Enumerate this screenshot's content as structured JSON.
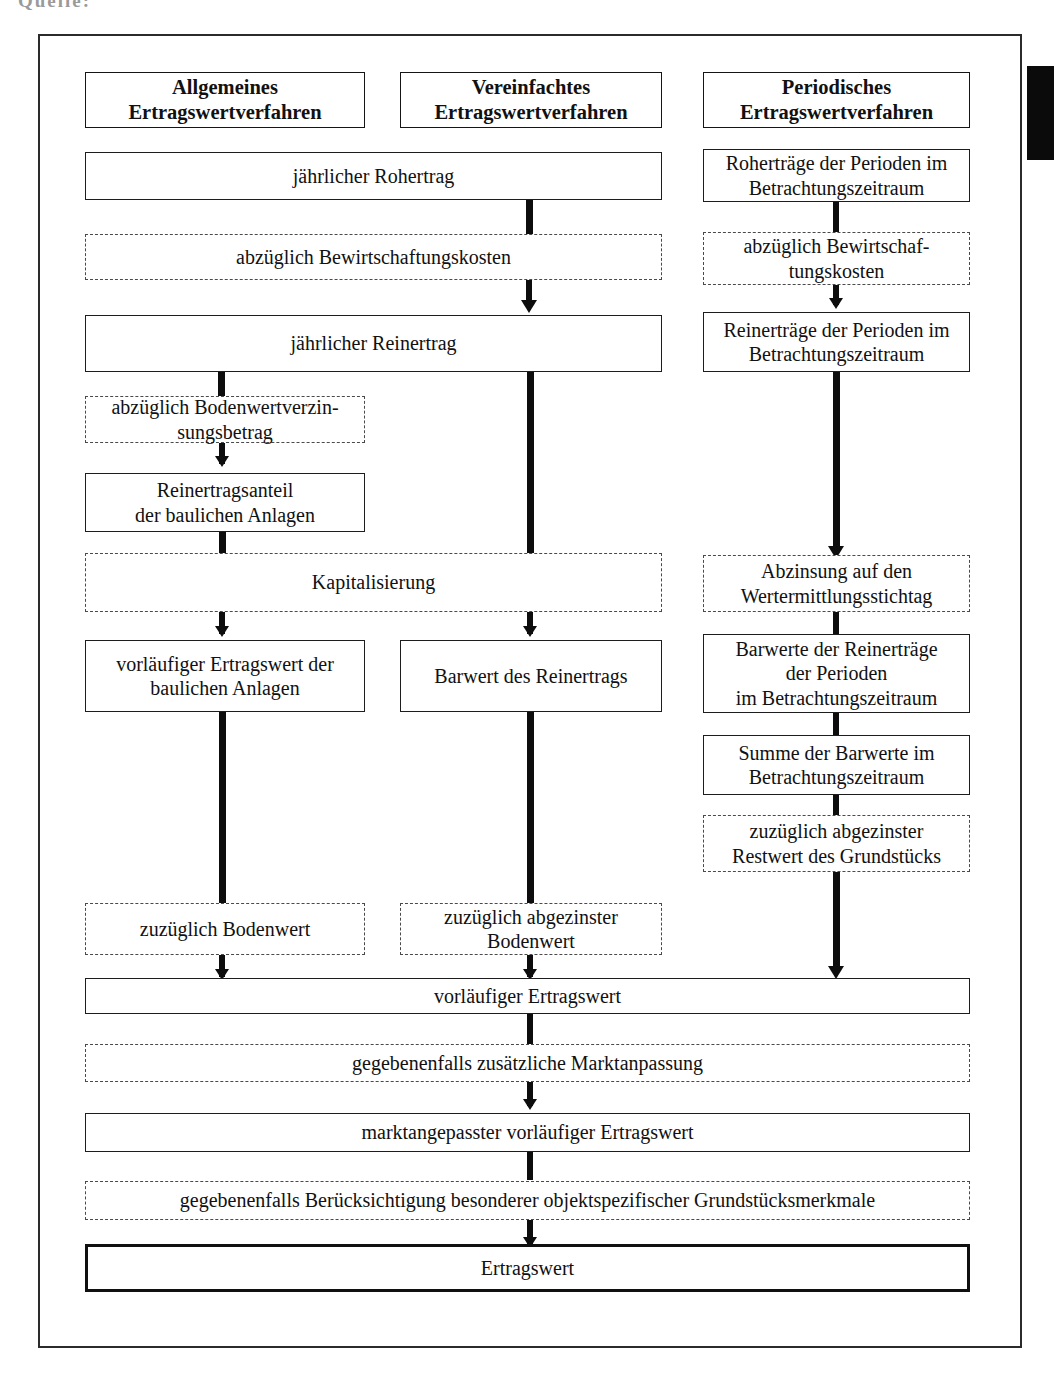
{
  "document": {
    "caption_remnant": "Quelle:",
    "frame_label": "Ertragswertverfahren Flussdiagramm"
  },
  "columns": {
    "left": {
      "header": "Allgemeines\nErtragswertverfahren",
      "header_line1": "Allgemeines",
      "header_line2": "Ertragswertverfahren"
    },
    "middle": {
      "header_line1": "Vereinfachtes",
      "header_line2": "Ertragswertverfahren"
    },
    "right": {
      "header_line1": "Periodisches",
      "header_line2": "Ertragswertverfahren"
    }
  },
  "nodes": {
    "roh_jahr": "jährlicher Rohertrag",
    "roh_perioden_l1": "Roherträge der Perioden im",
    "roh_perioden_l2": "Betrachtungszeitraum",
    "abzug_bewirt": "abzüglich Bewirtschaftungskosten",
    "abzug_bewirt_r_l1": "abzüglich Bewirtschaf-",
    "abzug_bewirt_r_l2": "tungskosten",
    "rein_jahr": "jährlicher Reinertrag",
    "rein_perioden_l1": "Reinerträge der Perioden im",
    "rein_perioden_l2": "Betrachtungszeitraum",
    "abzug_boden_l1": "abzüglich Bodenwertverzin-",
    "abzug_boden_l2": "sungsbetrag",
    "rein_anteil_l1": "Reinertragsanteil",
    "rein_anteil_l2": "der baulichen Anlagen",
    "kapitalisierung": "Kapitalisierung",
    "abzinsung_l1": "Abzinsung auf den",
    "abzinsung_l2": "Wertermittlungsstichtag",
    "vorl_ertrag_baul_l1": "vorläufiger Ertragswert der",
    "vorl_ertrag_baul_l2": "baulichen Anlagen",
    "barwert_rein": "Barwert des Reinertrags",
    "barwerte_perioden_l1": "Barwerte der Reinerträge",
    "barwerte_perioden_l2": "der Perioden",
    "barwerte_perioden_l3": "im Betrachtungszeitraum",
    "summe_barwerte_l1": "Summe der Barwerte im",
    "summe_barwerte_l2": "Betrachtungszeitraum",
    "zuzug_abgez_rest_l1": "zuzüglich abgezinster",
    "zuzug_abgez_rest_l2": "Restwert des Grundstücks",
    "zuzug_bodenwert": "zuzüglich Bodenwert",
    "zuzug_abgez_boden_l1": "zuzüglich abgezinster",
    "zuzug_abgez_boden_l2": "Bodenwert",
    "vorl_ertragswert": "vorläufiger Ertragswert",
    "marktanpassung": "gegebenenfalls zusätzliche Marktanpassung",
    "markt_vorl_ertragswert": "marktangepasster vorläufiger Ertragswert",
    "besondere_merkmale": "gegebenenfalls Berücksichtigung besonderer objektspezifischer Grundstücksmerkmale",
    "ertragswert": "Ertragswert"
  },
  "colors": {
    "border_solid": "#1d1d1d",
    "border_dashed": "#4a4a4a",
    "connector": "#0d0d0d",
    "frame": "#2b2b2b",
    "text": "#111111",
    "background": "#ffffff"
  }
}
